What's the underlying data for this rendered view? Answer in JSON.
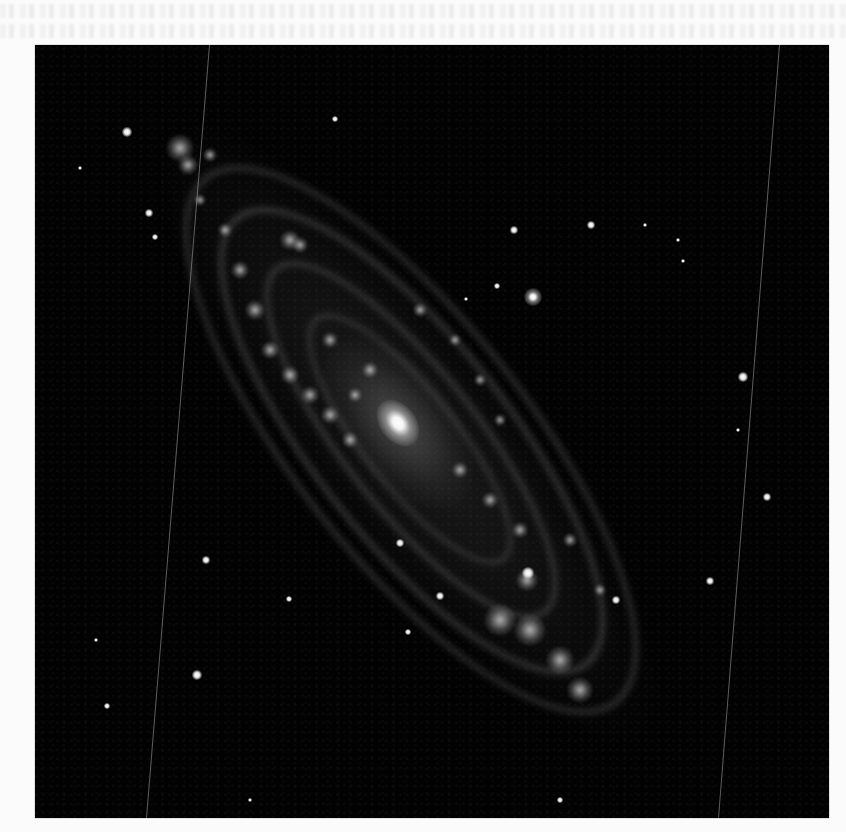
{
  "page": {
    "background": "#fbfbfb",
    "bleed_through_lines_y": [
      4,
      24
    ]
  },
  "figure": {
    "frame": {
      "x": 35,
      "y": 45,
      "width": 794,
      "height": 773,
      "background": "#020202"
    },
    "galaxy": {
      "nucleus": {
        "x": 398,
        "y": 423,
        "rx": 26,
        "ry": 18
      },
      "major_axis_angle_deg": 52,
      "extent": {
        "from": [
          168,
          135
        ],
        "to": [
          605,
          705
        ]
      },
      "companion": {
        "name": "M32",
        "x": 533,
        "y": 297,
        "r": 9
      }
    },
    "streaks": [
      {
        "x1": 209,
        "y1": 45,
        "x2": 146,
        "y2": 818
      },
      {
        "x1": 779,
        "y1": 45,
        "x2": 718,
        "y2": 818
      }
    ],
    "stars": [
      {
        "x": 127,
        "y": 132,
        "r": 5
      },
      {
        "x": 335,
        "y": 119,
        "r": 3
      },
      {
        "x": 149,
        "y": 213,
        "r": 4
      },
      {
        "x": 155,
        "y": 237,
        "r": 3
      },
      {
        "x": 80,
        "y": 168,
        "r": 2
      },
      {
        "x": 514,
        "y": 230,
        "r": 4
      },
      {
        "x": 591,
        "y": 225,
        "r": 4
      },
      {
        "x": 497,
        "y": 286,
        "r": 3
      },
      {
        "x": 743,
        "y": 377,
        "r": 5
      },
      {
        "x": 767,
        "y": 497,
        "r": 4
      },
      {
        "x": 710,
        "y": 581,
        "r": 4
      },
      {
        "x": 206,
        "y": 560,
        "r": 4
      },
      {
        "x": 289,
        "y": 599,
        "r": 3
      },
      {
        "x": 197,
        "y": 675,
        "r": 5
      },
      {
        "x": 107,
        "y": 706,
        "r": 3
      },
      {
        "x": 400,
        "y": 543,
        "r": 4
      },
      {
        "x": 440,
        "y": 596,
        "r": 4
      },
      {
        "x": 408,
        "y": 632,
        "r": 3
      },
      {
        "x": 616,
        "y": 600,
        "r": 4
      },
      {
        "x": 528,
        "y": 573,
        "r": 6
      },
      {
        "x": 645,
        "y": 225,
        "r": 2
      },
      {
        "x": 678,
        "y": 240,
        "r": 2
      },
      {
        "x": 683,
        "y": 261,
        "r": 2
      },
      {
        "x": 466,
        "y": 299,
        "r": 2
      },
      {
        "x": 96,
        "y": 640,
        "r": 2
      },
      {
        "x": 560,
        "y": 800,
        "r": 3
      },
      {
        "x": 738,
        "y": 430,
        "r": 2
      },
      {
        "x": 250,
        "y": 800,
        "r": 2
      }
    ],
    "knots": [
      {
        "x": 180,
        "y": 148,
        "r": 14
      },
      {
        "x": 188,
        "y": 165,
        "r": 10
      },
      {
        "x": 210,
        "y": 155,
        "r": 7
      },
      {
        "x": 290,
        "y": 240,
        "r": 10
      },
      {
        "x": 300,
        "y": 245,
        "r": 8
      },
      {
        "x": 240,
        "y": 270,
        "r": 9
      },
      {
        "x": 255,
        "y": 310,
        "r": 10
      },
      {
        "x": 270,
        "y": 350,
        "r": 9
      },
      {
        "x": 290,
        "y": 375,
        "r": 9
      },
      {
        "x": 310,
        "y": 395,
        "r": 9
      },
      {
        "x": 330,
        "y": 415,
        "r": 9
      },
      {
        "x": 350,
        "y": 440,
        "r": 8
      },
      {
        "x": 330,
        "y": 340,
        "r": 8
      },
      {
        "x": 370,
        "y": 370,
        "r": 8
      },
      {
        "x": 355,
        "y": 395,
        "r": 7
      },
      {
        "x": 420,
        "y": 310,
        "r": 7
      },
      {
        "x": 455,
        "y": 340,
        "r": 6
      },
      {
        "x": 480,
        "y": 380,
        "r": 6
      },
      {
        "x": 500,
        "y": 420,
        "r": 6
      },
      {
        "x": 460,
        "y": 470,
        "r": 8
      },
      {
        "x": 490,
        "y": 500,
        "r": 8
      },
      {
        "x": 520,
        "y": 530,
        "r": 8
      },
      {
        "x": 527,
        "y": 580,
        "r": 11
      },
      {
        "x": 500,
        "y": 620,
        "r": 16
      },
      {
        "x": 530,
        "y": 630,
        "r": 16
      },
      {
        "x": 560,
        "y": 660,
        "r": 14
      },
      {
        "x": 580,
        "y": 690,
        "r": 13
      },
      {
        "x": 570,
        "y": 540,
        "r": 7
      },
      {
        "x": 600,
        "y": 590,
        "r": 6
      },
      {
        "x": 225,
        "y": 230,
        "r": 7
      },
      {
        "x": 200,
        "y": 200,
        "r": 6
      }
    ]
  }
}
